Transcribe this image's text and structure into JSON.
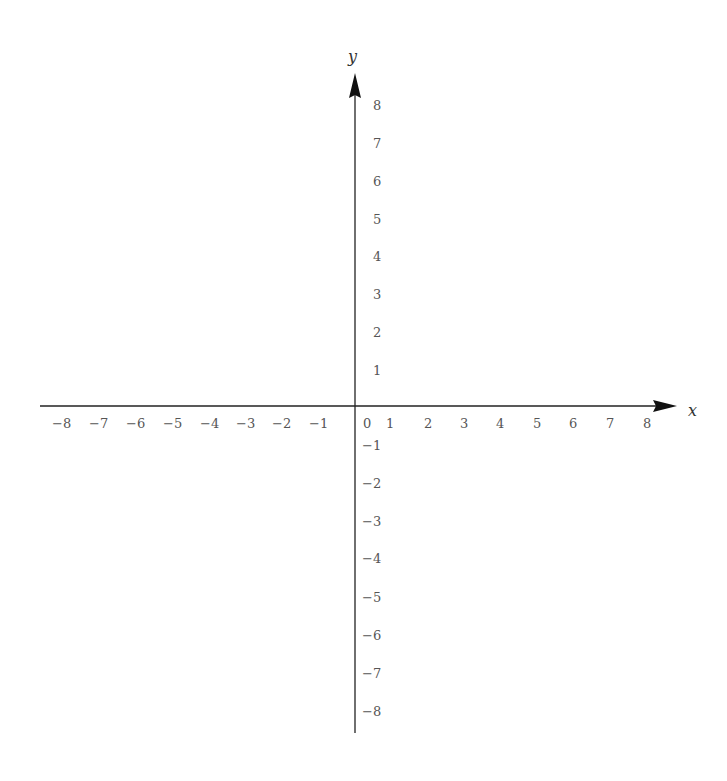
{
  "diagram": {
    "type": "cartesian-coordinate-plane",
    "x_axis": {
      "label": "x",
      "min": -8,
      "max": 8,
      "ticks": [
        "−8",
        "−7",
        "−6",
        "−5",
        "−4",
        "−3",
        "−2",
        "−1",
        "1",
        "2",
        "3",
        "4",
        "5",
        "6",
        "7",
        "8"
      ]
    },
    "y_axis": {
      "label": "y",
      "min": -8,
      "max": 8,
      "ticks": [
        "8",
        "7",
        "6",
        "5",
        "4",
        "3",
        "2",
        "1",
        "−1",
        "−2",
        "−3",
        "−4",
        "−5",
        "−6",
        "−7",
        "−8"
      ]
    },
    "origin_label": "0",
    "colors": {
      "axis": "#222222",
      "labels": "#555555",
      "background": "#ffffff"
    }
  }
}
